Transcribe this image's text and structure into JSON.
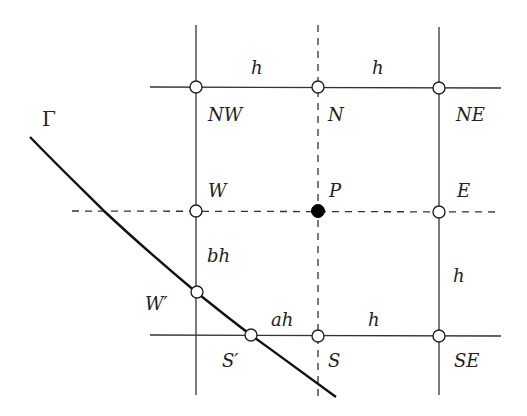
{
  "diagram": {
    "type": "finite-difference-stencil",
    "boundary_label": "Γ",
    "grid": {
      "vertical_lines": [
        {
          "x": 196,
          "style": "solid"
        },
        {
          "x": 318,
          "style": "dashed"
        },
        {
          "x": 439,
          "style": "solid"
        }
      ],
      "horizontal_lines": [
        {
          "y": 87,
          "style": "solid"
        },
        {
          "y": 211,
          "style": "dashed"
        },
        {
          "y": 335,
          "style": "solid"
        }
      ]
    },
    "nodes": [
      {
        "id": "NW",
        "label": "NW",
        "x": 196,
        "y": 87,
        "filled": false
      },
      {
        "id": "N",
        "label": "N",
        "x": 318,
        "y": 87,
        "filled": false
      },
      {
        "id": "NE",
        "label": "NE",
        "x": 439,
        "y": 87,
        "filled": false
      },
      {
        "id": "W",
        "label": "W",
        "x": 196,
        "y": 211,
        "filled": false
      },
      {
        "id": "P",
        "label": "P",
        "x": 318,
        "y": 211,
        "filled": true
      },
      {
        "id": "E",
        "label": "E",
        "x": 439,
        "y": 211,
        "filled": false
      },
      {
        "id": "Wp",
        "label": "W′",
        "x": 196,
        "y": 292,
        "filled": false
      },
      {
        "id": "Sp",
        "label": "S′",
        "x": 251,
        "y": 335,
        "filled": false
      },
      {
        "id": "S",
        "label": "S",
        "x": 318,
        "y": 335,
        "filled": false
      },
      {
        "id": "SE",
        "label": "SE",
        "x": 439,
        "y": 335,
        "filled": false
      }
    ],
    "spacing_labels": [
      {
        "text": "h",
        "position": "top-left span"
      },
      {
        "text": "h",
        "position": "top-right span"
      },
      {
        "text": "bh",
        "position": "W to W′"
      },
      {
        "text": "h",
        "position": "E to SE"
      },
      {
        "text": "ah",
        "position": "S′ to S"
      },
      {
        "text": "h",
        "position": "S to SE"
      }
    ],
    "labels": {
      "gamma": "Γ",
      "h_top_left": "h",
      "h_top_right": "h",
      "NW": "NW",
      "N": "N",
      "NE": "NE",
      "W": "W",
      "P": "P",
      "E": "E",
      "bh": "bh",
      "h_right": "h",
      "W_prime": "W′",
      "ah": "ah",
      "h_bottom": "h",
      "S_prime": "S′",
      "S": "S",
      "SE": "SE"
    }
  }
}
